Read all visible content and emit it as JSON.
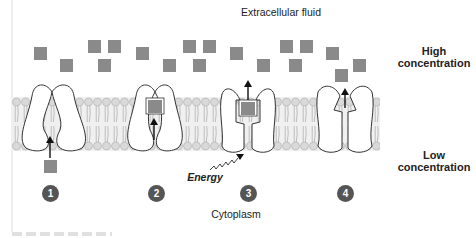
{
  "labels": {
    "extracellular": "Extracellular fluid",
    "high": "High concentration",
    "low": "Low concentration",
    "energy": "Energy",
    "cytoplasm": "Cytoplasm"
  },
  "steps": [
    {
      "number": "1"
    },
    {
      "number": "2"
    },
    {
      "number": "3"
    },
    {
      "number": "4"
    }
  ],
  "colors": {
    "solute": "#8a8a8a",
    "membrane_head": "#d9d9d9",
    "membrane_fill": "#efefef",
    "protein_outline": "#333333",
    "step_badge": "#555555"
  },
  "solutes_extracellular": [
    [
      34,
      47
    ],
    [
      60,
      59
    ],
    [
      88,
      40
    ],
    [
      108,
      40
    ],
    [
      98,
      59
    ],
    [
      136,
      47
    ],
    [
      163,
      59
    ],
    [
      183,
      40
    ],
    [
      203,
      40
    ],
    [
      193,
      59
    ],
    [
      230,
      47
    ],
    [
      257,
      59
    ],
    [
      280,
      40
    ],
    [
      300,
      40
    ],
    [
      289,
      59
    ],
    [
      326,
      47
    ],
    [
      353,
      59
    ],
    [
      335,
      69
    ]
  ]
}
